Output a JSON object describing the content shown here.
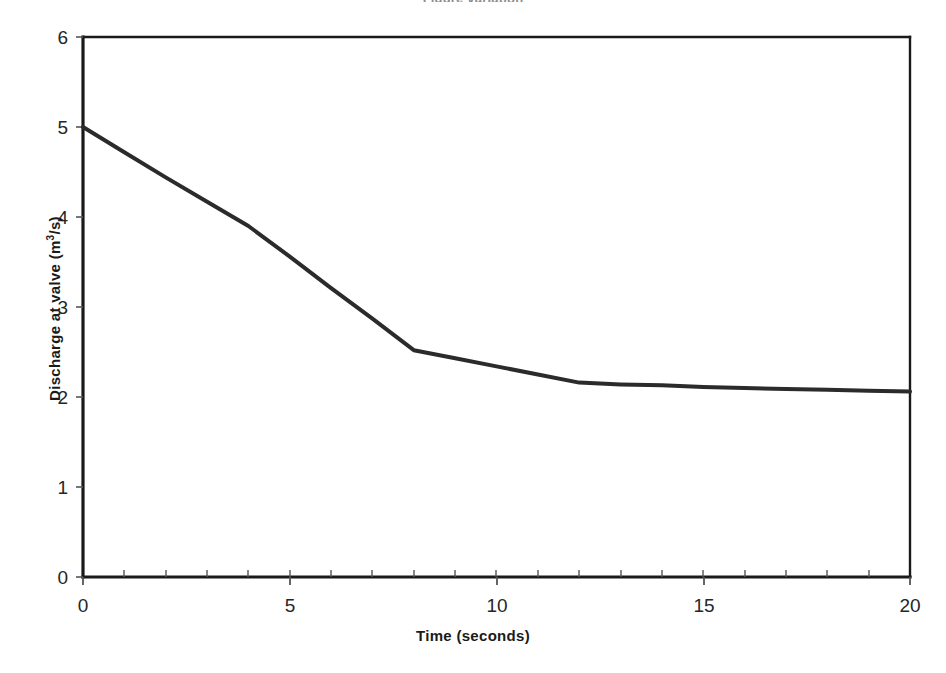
{
  "figure": {
    "title_cropped": "Figure  variation",
    "background_color": "#ffffff",
    "line_color": "#2b2b2b",
    "axis_color": "#1a1a1a"
  },
  "chart_data": {
    "type": "line",
    "title": "",
    "xlabel": "Time (seconds)",
    "ylabel": "Discharge at valve (m3/s)",
    "ylabel_parts": {
      "before": "Discharge at valve (m",
      "superscript": "3",
      "after": "/s)"
    },
    "xlim": [
      0,
      20
    ],
    "ylim": [
      0,
      6
    ],
    "xticks": [
      0,
      5,
      10,
      15,
      20
    ],
    "xtick_labels": [
      "0",
      "5",
      "10",
      "15",
      "20"
    ],
    "x_minor_tick_step": 1,
    "yticks": [
      0,
      1,
      2,
      3,
      4,
      5,
      6
    ],
    "ytick_labels": [
      "0",
      "1",
      "2",
      "3",
      "4",
      "5",
      "6"
    ],
    "grid": false,
    "legend": null,
    "series": [
      {
        "name": "Discharge at valve",
        "x": [
          0,
          1,
          2,
          3,
          4,
          5,
          6,
          7,
          8,
          9,
          10,
          11,
          12,
          13,
          14,
          15,
          16,
          17,
          18,
          19,
          20
        ],
        "values": [
          5.0,
          4.72,
          4.44,
          4.17,
          3.9,
          3.56,
          3.21,
          2.87,
          2.52,
          2.43,
          2.34,
          2.25,
          2.16,
          2.14,
          2.13,
          2.11,
          2.1,
          2.09,
          2.08,
          2.07,
          2.06
        ]
      }
    ],
    "annotations": []
  },
  "axes": {
    "x_axis_name": "time-axis",
    "y_axis_name": "discharge-axis"
  }
}
